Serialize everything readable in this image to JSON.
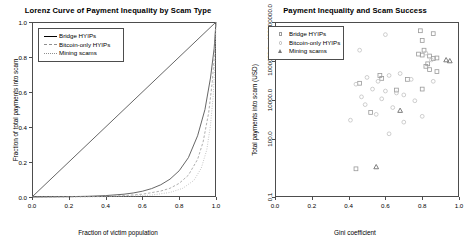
{
  "chart_data": [
    {
      "type": "line",
      "panel": "left",
      "title": "Lorenz Curve of Payment Inequality by Scam Type",
      "xlabel": "Fraction of victim population",
      "ylabel": "Fraction of total payments into scam",
      "xlim": [
        0,
        1
      ],
      "ylim": [
        0,
        1
      ],
      "xticks": [
        "0.0",
        "0.2",
        "0.4",
        "0.6",
        "0.8",
        "1.0"
      ],
      "xtickvals": [
        0.0,
        0.2,
        0.4,
        0.6,
        0.8,
        1.0
      ],
      "yticks": [
        "0.0",
        "0.2",
        "0.4",
        "0.6",
        "0.8",
        "1.0"
      ],
      "ytickvals": [
        0.0,
        0.2,
        0.4,
        0.6,
        0.8,
        1.0
      ],
      "grid": false,
      "legend_position": "top-left",
      "series": [
        {
          "name": "Equality line",
          "style": "solid",
          "color": "#555555",
          "x": [
            0.0,
            1.0
          ],
          "y": [
            0.0,
            1.0
          ]
        },
        {
          "name": "Bridge HYIPs",
          "style": "solid",
          "color": "#555555",
          "x": [
            0.0,
            0.1,
            0.2,
            0.3,
            0.4,
            0.5,
            0.55,
            0.6,
            0.65,
            0.7,
            0.75,
            0.8,
            0.85,
            0.9,
            0.94,
            0.97,
            0.99,
            1.0
          ],
          "y": [
            0.0,
            0.001,
            0.002,
            0.004,
            0.008,
            0.016,
            0.023,
            0.033,
            0.048,
            0.07,
            0.102,
            0.15,
            0.225,
            0.35,
            0.5,
            0.68,
            0.85,
            1.0
          ]
        },
        {
          "name": "Bitcoin-only HYIPs",
          "style": "dashed",
          "color": "#9a9a9a",
          "x": [
            0.0,
            0.1,
            0.2,
            0.3,
            0.4,
            0.5,
            0.6,
            0.7,
            0.75,
            0.8,
            0.85,
            0.9,
            0.93,
            0.96,
            0.98,
            0.99,
            1.0
          ],
          "y": [
            0.0,
            0.0,
            0.001,
            0.002,
            0.004,
            0.008,
            0.016,
            0.034,
            0.05,
            0.078,
            0.125,
            0.215,
            0.315,
            0.48,
            0.66,
            0.8,
            1.0
          ]
        },
        {
          "name": "Mining scams",
          "style": "dotted",
          "color": "#a8a8a8",
          "x": [
            0.0,
            0.2,
            0.4,
            0.55,
            0.65,
            0.75,
            0.82,
            0.88,
            0.92,
            0.95,
            0.97,
            0.985,
            0.995,
            1.0
          ],
          "y": [
            0.0,
            0.0,
            0.002,
            0.005,
            0.011,
            0.026,
            0.05,
            0.095,
            0.165,
            0.27,
            0.41,
            0.58,
            0.79,
            1.0
          ]
        }
      ]
    },
    {
      "type": "scatter",
      "panel": "right",
      "title": "Payment Inequality and Scam Success",
      "xlabel": "Gini coefficient",
      "ylabel": "Total payments into scam (USD)",
      "xlim": [
        0,
        1
      ],
      "ylim_log10": [
        -1,
        8
      ],
      "yscale": "log",
      "xticks": [
        "0.0",
        "0.2",
        "0.4",
        "0.6",
        "0.8",
        "1.0"
      ],
      "xtickvals": [
        0.0,
        0.2,
        0.4,
        0.6,
        0.8,
        1.0
      ],
      "yticks": [
        "0.1",
        "100.0",
        "10000.0",
        "1000000.0",
        "100000000.0"
      ],
      "ytickvals_log10": [
        -1,
        2,
        4,
        6,
        8
      ],
      "grid": false,
      "legend_position": "top-left",
      "series": [
        {
          "name": "Bridge HYIPs",
          "marker": "square",
          "color": "#9a9a9a",
          "points": [
            [
              0.79,
              7.55
            ],
            [
              0.86,
              7.4
            ],
            [
              0.8,
              7.05
            ],
            [
              0.81,
              6.55
            ],
            [
              0.78,
              6.35
            ],
            [
              0.8,
              6.3
            ],
            [
              0.84,
              6.25
            ],
            [
              0.88,
              6.15
            ],
            [
              0.86,
              6.12
            ],
            [
              0.83,
              5.85
            ],
            [
              0.82,
              5.72
            ],
            [
              0.84,
              5.55
            ],
            [
              0.88,
              5.45
            ],
            [
              0.57,
              5.25
            ],
            [
              0.58,
              5.1
            ],
            [
              0.72,
              5.05
            ],
            [
              0.46,
              4.85
            ],
            [
              0.8,
              4.55
            ],
            [
              0.66,
              4.5
            ],
            [
              0.52,
              3.35
            ],
            [
              0.44,
              0.45
            ]
          ]
        },
        {
          "name": "Bitcoin-only HYIPs",
          "marker": "circle",
          "color": "#c2c2c2",
          "points": [
            [
              0.6,
              7.35
            ],
            [
              0.46,
              6.55
            ],
            [
              0.82,
              6.4
            ],
            [
              0.85,
              6.05
            ],
            [
              0.68,
              5.35
            ],
            [
              0.62,
              5.25
            ],
            [
              0.5,
              5.15
            ],
            [
              0.74,
              5.05
            ],
            [
              0.56,
              4.95
            ],
            [
              0.86,
              4.95
            ],
            [
              0.44,
              4.8
            ],
            [
              0.53,
              4.55
            ],
            [
              0.6,
              4.45
            ],
            [
              0.66,
              4.35
            ],
            [
              0.7,
              4.25
            ],
            [
              0.47,
              4.15
            ],
            [
              0.58,
              4.05
            ],
            [
              0.76,
              3.95
            ],
            [
              0.49,
              3.75
            ],
            [
              0.64,
              3.6
            ],
            [
              0.55,
              3.25
            ],
            [
              0.8,
              3.15
            ],
            [
              0.41,
              2.95
            ],
            [
              0.7,
              2.85
            ],
            [
              0.62,
              2.25
            ]
          ]
        },
        {
          "name": "Mining scams",
          "marker": "triangle",
          "color": "#6f6f6f",
          "points": [
            [
              0.93,
              6.05
            ],
            [
              0.95,
              6.0
            ],
            [
              0.68,
              3.45
            ],
            [
              0.55,
              0.55
            ]
          ]
        }
      ]
    }
  ],
  "left_panel": {
    "title": "Lorenz Curve of Payment Inequality by Scam Type",
    "xlabel": "Fraction of victim population",
    "ylabel": "Fraction of total payments into scam",
    "legend": [
      {
        "label": "Bridge HYIPs",
        "style": "solid"
      },
      {
        "label": "Bitcoin-only HYIPs",
        "style": "dashed"
      },
      {
        "label": "Mining scams",
        "style": "dotted"
      }
    ],
    "xticks": [
      "0.0",
      "0.2",
      "0.4",
      "0.6",
      "0.8",
      "1.0"
    ],
    "yticks": [
      "0.0",
      "0.2",
      "0.4",
      "0.6",
      "0.8",
      "1.0"
    ]
  },
  "right_panel": {
    "title": "Payment Inequality and Scam Success",
    "xlabel": "Gini coefficient",
    "ylabel": "Total payments into scam (USD)",
    "legend": [
      {
        "label": "Bridge HYIPs",
        "marker": "square"
      },
      {
        "label": "Bitcoin-only HYIPs",
        "marker": "circle"
      },
      {
        "label": "Mining scams",
        "marker": "triangle"
      }
    ],
    "xticks": [
      "0.0",
      "0.2",
      "0.4",
      "0.6",
      "0.8",
      "1.0"
    ],
    "yticks": [
      "0.1",
      "100.0",
      "10000.0",
      "1000000.0",
      "100000000.0"
    ]
  }
}
